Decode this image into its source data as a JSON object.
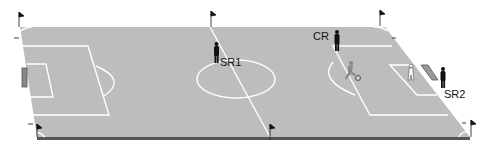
{
  "diagram": {
    "type": "soccer-field-perspective",
    "colors": {
      "pitch": "#bdbdbd",
      "lines": "#ffffff",
      "edge": "#555555",
      "figures": "#111111",
      "player": "#8a8a8a"
    },
    "labels": {
      "cr": "CR",
      "sr1": "SR1",
      "sr2": "SR2"
    },
    "figures": [
      {
        "id": "CR",
        "role": "referee",
        "label": "CR"
      },
      {
        "id": "SR1",
        "role": "assistant-referee",
        "label": "SR1"
      },
      {
        "id": "SR2",
        "role": "assistant-referee",
        "label": "SR2"
      },
      {
        "id": "attacker",
        "role": "player-with-ball",
        "label": ""
      },
      {
        "id": "goalkeeper",
        "role": "goalkeeper",
        "label": ""
      }
    ],
    "flags": [
      "top-left-corner",
      "top-halfway",
      "top-right-corner",
      "bottom-left-corner",
      "bottom-halfway",
      "bottom-right-corner"
    ]
  }
}
